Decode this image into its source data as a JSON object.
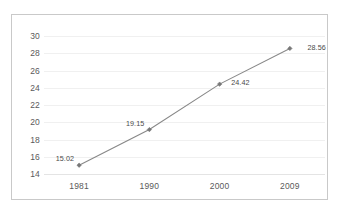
{
  "chart_data": {
    "type": "line",
    "title": "",
    "subtitle": "",
    "xlabel": "",
    "ylabel": "",
    "categories": [
      "1981",
      "1990",
      "2000",
      "2009"
    ],
    "values": [
      15.02,
      19.15,
      24.42,
      28.56
    ],
    "point_labels": [
      "15.02",
      "19.15",
      "24.42",
      "28.56"
    ],
    "series": [
      {
        "name": "",
        "values": [
          15.02,
          19.15,
          24.42,
          28.56
        ]
      }
    ],
    "ylim": [
      14,
      30
    ],
    "ytick_values": [
      14,
      16,
      18,
      20,
      22,
      24,
      26,
      28,
      30
    ],
    "ytick_labels": [
      "14",
      "16",
      "18",
      "20",
      "22",
      "24",
      "26",
      "28",
      "30"
    ],
    "ytick_step": 2,
    "xtick_labels": [
      "1981",
      "1990",
      "2000",
      "2009"
    ],
    "grid": "horizontal",
    "legend": "none",
    "marker": "diamond",
    "colors": {
      "line": "#888888",
      "marker": "#777777",
      "gridline": "#f0f0f0",
      "border": "#c9c9c9",
      "tick_text": "#5a5a5a",
      "label_text": "#4a4a4a",
      "background": "#ffffff"
    }
  }
}
